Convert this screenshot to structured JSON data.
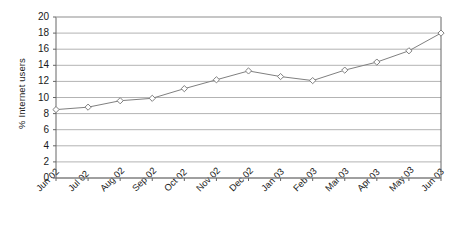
{
  "chart_data": {
    "type": "line",
    "title": "",
    "subtitle": "",
    "xlabel": "",
    "ylabel": "% Internet users",
    "categories": [
      "Jun 02",
      "Jul 02",
      "Aug 02",
      "Sep 02",
      "Oct 02",
      "Nov 02",
      "Dec 02",
      "Jan 03",
      "Feb 03",
      "Mar 03",
      "Apr 03",
      "May 03",
      "Jun 03"
    ],
    "values": [
      8.5,
      8.8,
      9.6,
      9.9,
      11.1,
      12.2,
      13.3,
      12.6,
      12.1,
      13.4,
      14.4,
      15.8,
      18.0
    ],
    "series": [
      {
        "name": "% Internet users",
        "values": [
          8.5,
          8.8,
          9.6,
          9.9,
          11.1,
          12.2,
          13.3,
          12.6,
          12.1,
          13.4,
          14.4,
          15.8,
          18.0
        ]
      }
    ],
    "ylim": [
      0,
      20
    ],
    "ytick_values": [
      0,
      2,
      4,
      6,
      8,
      10,
      12,
      14,
      16,
      18,
      20
    ],
    "ytick_labels": [
      "0",
      "2",
      "4",
      "6",
      "8",
      "10",
      "12",
      "14",
      "16",
      "18",
      "20"
    ],
    "grid": "horizontal",
    "legend": "none",
    "marker": "diamond",
    "colors": {
      "line": "#808080",
      "marker_fill": "#ffffff",
      "marker_stroke": "#808080",
      "gridline": "#b3b3b3",
      "axis": "#666666",
      "text": "#1a1a1a",
      "background": "#ffffff"
    }
  }
}
